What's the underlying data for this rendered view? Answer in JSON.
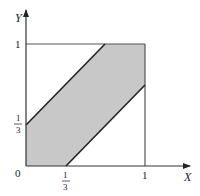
{
  "diagram": {
    "type": "region-plot",
    "axes": {
      "x_label": "X",
      "y_label": "Y",
      "origin_label": "0"
    },
    "ticks": {
      "x_one_third": {
        "num": "1",
        "den": "3"
      },
      "x_one": "1",
      "y_one_third": {
        "num": "1",
        "den": "3"
      },
      "y_one": "1"
    },
    "region": {
      "fill_color": "#c8c8c8",
      "line_color": "#222222",
      "vertices_math": [
        [
          0,
          0
        ],
        [
          0,
          0.3333
        ],
        [
          0.6667,
          1
        ],
        [
          1,
          1
        ],
        [
          1,
          0.6667
        ],
        [
          0.3333,
          0
        ]
      ],
      "boundary_lines": [
        "Y = X + 1/3",
        "Y = X - 1/3"
      ]
    },
    "unit_square": {
      "x_range": [
        0,
        1
      ],
      "y_range": [
        0,
        1
      ]
    }
  }
}
